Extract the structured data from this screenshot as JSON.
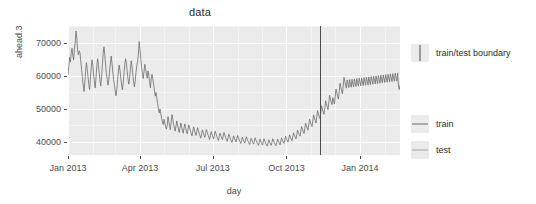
{
  "chart_data": {
    "type": "line",
    "title": "data",
    "xlabel": "day",
    "ylabel": "ahead.3",
    "grid": true,
    "legend_position": "right",
    "ylim": [
      36000,
      75000
    ],
    "xlim": [
      "2013-01-01",
      "2014-02-20"
    ],
    "ytick_labels": [
      "40000",
      "50000",
      "60000",
      "70000"
    ],
    "ytick_values": [
      40000,
      50000,
      60000,
      70000
    ],
    "xtick_labels": [
      "Jan 2013",
      "Apr 2013",
      "Jul 2013",
      "Oct 2013",
      "Jan 2014"
    ],
    "xtick_values": [
      "2013-01-01",
      "2013-04-01",
      "2013-07-01",
      "2013-10-01",
      "2014-01-01"
    ],
    "annotations": [
      {
        "name": "train/test boundary",
        "type": "vline",
        "x": "2013-11-12",
        "color": "#4d4d4d"
      }
    ],
    "legend": [
      {
        "title": "",
        "entries": [
          {
            "label": "train/test boundary",
            "marker": "vline",
            "color": "#4d4d4d"
          }
        ]
      },
      {
        "title": "",
        "entries": [
          {
            "label": "train",
            "marker": "hline",
            "color": "#6b6b6b"
          },
          {
            "label": "test",
            "marker": "hline",
            "color": "#a0a0a0"
          }
        ]
      }
    ],
    "series": [
      {
        "name": "ahead.3",
        "color": "#6b6b6b",
        "x_start": "2013-01-01",
        "x_step_days": 1,
        "values": [
          60200,
          62800,
          65500,
          64100,
          66800,
          68300,
          66200,
          64700,
          67900,
          70100,
          73500,
          71200,
          67600,
          66300,
          67500,
          66900,
          64200,
          61800,
          59400,
          57200,
          55200,
          57800,
          61200,
          63900,
          62100,
          59700,
          57400,
          55800,
          58900,
          62400,
          64800,
          63100,
          60200,
          58100,
          56300,
          59400,
          62800,
          65100,
          63400,
          60800,
          58400,
          56900,
          59800,
          63200,
          66900,
          68700,
          66100,
          63200,
          60700,
          58900,
          57100,
          58600,
          61400,
          63800,
          65900,
          63700,
          61100,
          58800,
          57300,
          55400,
          53900,
          55800,
          58700,
          61300,
          63200,
          61600,
          59100,
          57200,
          55700,
          57900,
          60800,
          63400,
          65100,
          63600,
          61200,
          59000,
          57400,
          59200,
          62100,
          64500,
          62800,
          60300,
          58100,
          56600,
          58400,
          61000,
          63100,
          64300,
          66500,
          70300,
          67800,
          64900,
          62400,
          60700,
          59100,
          61200,
          63400,
          62100,
          60500,
          59200,
          61400,
          60100,
          58200,
          56300,
          58900,
          60400,
          59100,
          57300,
          55600,
          53800,
          54900,
          53200,
          51600,
          50100,
          48700,
          49900,
          48400,
          47200,
          46100,
          45200,
          46800,
          45600,
          44500,
          43800,
          45100,
          47600,
          46200,
          44700,
          43600,
          45900,
          48200,
          46800,
          45300,
          44100,
          43200,
          44800,
          46300,
          45100,
          43900,
          42800,
          44200,
          45700,
          44600,
          43500,
          42600,
          44100,
          45400,
          44300,
          43200,
          42400,
          43700,
          45100,
          44200,
          43300,
          42500,
          41800,
          43200,
          44500,
          43600,
          42700,
          41900,
          43100,
          44300,
          43400,
          42600,
          41800,
          41100,
          42400,
          43600,
          42800,
          42000,
          41300,
          42500,
          43700,
          42900,
          42100,
          41400,
          40700,
          41900,
          43100,
          42300,
          41500,
          40900,
          42000,
          43200,
          42400,
          41700,
          41000,
          40400,
          41500,
          42600,
          41900,
          41200,
          40600,
          41700,
          42800,
          42000,
          41300,
          40700,
          40100,
          41200,
          42300,
          41600,
          40900,
          40300,
          39800,
          40800,
          41800,
          41100,
          40500,
          39900,
          40900,
          41900,
          41200,
          40600,
          40000,
          39500,
          40400,
          41400,
          40700,
          40100,
          39600,
          40500,
          41500,
          40800,
          40200,
          39700,
          39200,
          40100,
          41100,
          40400,
          39800,
          39300,
          40200,
          41200,
          40500,
          39900,
          39400,
          38900,
          39800,
          40800,
          40100,
          39500,
          39000,
          39900,
          40900,
          40200,
          39600,
          39100,
          38700,
          39600,
          40600,
          40000,
          39400,
          38900,
          39900,
          40900,
          40300,
          39700,
          39200,
          38800,
          39800,
          40800,
          40200,
          39600,
          39100,
          40200,
          41200,
          40600,
          40000,
          39500,
          40600,
          41700,
          41000,
          40400,
          39900,
          41000,
          42100,
          41400,
          40800,
          40300,
          41500,
          42700,
          42000,
          41400,
          40900,
          42200,
          43500,
          42800,
          42200,
          41700,
          43100,
          44600,
          43800,
          43100,
          42500,
          44000,
          45600,
          44800,
          44100,
          43500,
          45100,
          46800,
          46000,
          45200,
          44600,
          46300,
          48100,
          47200,
          46400,
          45700,
          47500,
          49400,
          48500,
          47700,
          47000,
          48900,
          50900,
          49900,
          49000,
          48300,
          50300,
          52400,
          51400,
          50500,
          49700,
          51800,
          54100,
          53000,
          52000,
          51200,
          53300,
          52300,
          51400,
          53600,
          55900,
          54800,
          53800,
          52900,
          55200,
          57700,
          56500,
          55400,
          54500,
          56900,
          59500,
          58200,
          57100,
          56200,
          58700,
          57500,
          56400,
          58800,
          57600,
          56500,
          58900,
          57700,
          56600,
          59000,
          57800,
          56700,
          59100,
          57900,
          56800,
          59200,
          58000,
          56900,
          59300,
          58100,
          57000,
          59400,
          58200,
          57100,
          59500,
          58300,
          57200,
          59600,
          58400,
          57300,
          59700,
          58500,
          57400,
          59800,
          58600,
          57500,
          59900,
          58700,
          57600,
          60000,
          58800,
          57700,
          60100,
          58900,
          57800,
          60200,
          59000,
          57900,
          60300,
          59100,
          58000,
          60400,
          59200,
          58100,
          60500,
          59300,
          58200,
          60600,
          59400,
          58300,
          60700,
          59500,
          58400,
          60800,
          57200,
          55800,
          56900,
          58100,
          56300,
          55100,
          56400,
          57900,
          59300,
          60900,
          59600,
          58200,
          57000,
          58400,
          57100,
          55900,
          57300,
          58900,
          57600,
          56200
        ]
      }
    ]
  },
  "panel": {
    "background_color": "#ebebeb",
    "major_grid_color": "#ffffff",
    "minor_grid_color": "#f4f4f4"
  }
}
